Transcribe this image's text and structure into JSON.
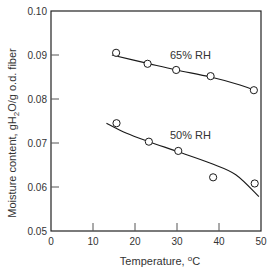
{
  "chart_data": {
    "type": "scatter",
    "title": "",
    "xlabel": "Temperature, °C",
    "ylabel": "Moisture content, gH2O/g o.d. fiber",
    "xlim": [
      0,
      50
    ],
    "ylim": [
      0.05,
      0.1
    ],
    "xticks": [
      0,
      10,
      20,
      30,
      40,
      50
    ],
    "xtick_labels": [
      "0",
      "10",
      "20",
      "30",
      "40",
      "50"
    ],
    "yticks": [
      0.05,
      0.06,
      0.07,
      0.08,
      0.09,
      0.1
    ],
    "ytick_labels": [
      "0.05",
      "0.06",
      "0.07",
      "0.08",
      "0.09",
      "0.10"
    ],
    "grid": false,
    "legend": "none (inline series labels)",
    "series": [
      {
        "name": "65% RH",
        "marker": "open-circle",
        "x": [
          15.5,
          23.0,
          29.8,
          38.0,
          48.3
        ],
        "y": [
          0.0905,
          0.088,
          0.0866,
          0.0852,
          0.082
        ],
        "fit_curve": {
          "x": [
            14.5,
            23.0,
            29.8,
            38.0,
            45.0,
            49.0
          ],
          "y": [
            0.09,
            0.0881,
            0.0866,
            0.085,
            0.0832,
            0.0818
          ]
        },
        "label_position": {
          "x": 28.5,
          "y": 0.09
        }
      },
      {
        "name": "50% RH",
        "marker": "open-circle",
        "x": [
          15.6,
          23.3,
          30.3,
          38.6,
          48.5
        ],
        "y": [
          0.0745,
          0.0703,
          0.0682,
          0.0622,
          0.0608
        ],
        "fit_curve": {
          "x": [
            13.2,
            18.0,
            23.3,
            30.3,
            38.0,
            44.0,
            49.5
          ],
          "y": [
            0.0745,
            0.0722,
            0.0703,
            0.068,
            0.0654,
            0.0628,
            0.0578
          ]
        },
        "label_position": {
          "x": 28.5,
          "y": 0.0727
        }
      }
    ]
  },
  "labels": {
    "xlabel_main": "Temperature, ",
    "xlabel_degree": "o",
    "xlabel_unit": "C",
    "ylabel_prefix": "Moisture content, gH",
    "ylabel_sub": "2",
    "ylabel_suffix": "O/g o.d. fiber",
    "series_65": "65% RH",
    "series_50": "50% RH"
  },
  "colors": {
    "axis": "#222222",
    "line": "#1a1a1a",
    "text": "#333333",
    "background": "#ffffff"
  }
}
